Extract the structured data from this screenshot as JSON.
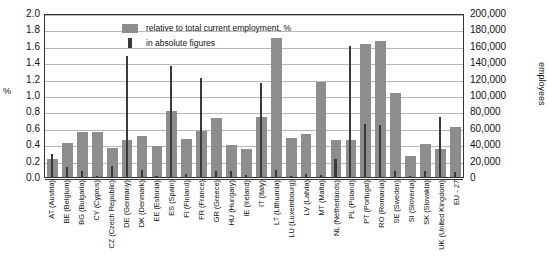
{
  "chart_data": {
    "type": "bar",
    "title": "",
    "xlabel": "",
    "ylabel": "%",
    "ylabel_right": "employees",
    "ylim": [
      0,
      2.0
    ],
    "ylim_right": [
      0,
      200000
    ],
    "yticks": [
      "2.0",
      "1.8",
      "1.6",
      "1.4",
      "1.2",
      "1.0",
      "0.8",
      "0.6",
      "0.4",
      "0.2",
      "0.0"
    ],
    "yticks_right": [
      "200,000",
      "180,000",
      "160,000",
      "140,000",
      "120,000",
      "100,000",
      "80,000",
      "60,000",
      "40,000",
      "20,000",
      "0"
    ],
    "grid": true,
    "legend_position": "top-center",
    "legend": [
      {
        "key": "relative",
        "label": "relative to total current employment, %",
        "color": "#8d8d8d",
        "marker": "wide-bar"
      },
      {
        "key": "absolute",
        "label": "in absolute figures",
        "color": "#3a3a3a",
        "marker": "narrow-bar"
      }
    ],
    "categories": [
      "AT (Austria)",
      "BE (Belgium)",
      "BG (Bulgaria)",
      "CY (Cyprus)",
      "CZ (Czech Republic)",
      "DE (Germany)",
      "DK (Denmark)",
      "EE (Estonia)",
      "ES (Spain)",
      "FI (Finland)",
      "FR (France)",
      "GR (Greece)",
      "HU (Hungary)",
      "IE (Ireland)",
      "IT (Italy)",
      "LT (Lithuania)",
      "LU (Luxembourg)",
      "LV (Latvia)",
      "MT (Malta)",
      "NL (Netherlands)",
      "PL (Poland)",
      "PT (Portugal)",
      "RO (Romania)",
      "SE (Sweden)",
      "SI (Slovenia)",
      "SK (Slovakia)",
      "UK (United Kingdom)",
      "EU - 27"
    ],
    "series": [
      {
        "name": "relative to total current employment, %",
        "unit": "%",
        "axis": "left",
        "color": "#8d8d8d",
        "values": [
          0.22,
          0.41,
          0.55,
          0.55,
          0.35,
          0.45,
          0.5,
          0.38,
          0.81,
          0.46,
          0.56,
          0.72,
          0.39,
          0.34,
          0.73,
          1.7,
          0.48,
          0.52,
          1.16,
          0.45,
          0.45,
          1.62,
          1.66,
          1.02,
          0.26,
          0.4,
          0.34,
          0.61
        ]
      },
      {
        "name": "in absolute figures",
        "unit": "employees",
        "axis": "right",
        "color": "#3a3a3a",
        "values": [
          28000,
          12000,
          7000,
          1000,
          14000,
          147000,
          8000,
          1000,
          135000,
          4000,
          121000,
          7000,
          7000,
          3000,
          115000,
          8000,
          1000,
          4000,
          3000,
          22000,
          160000,
          65000,
          64000,
          7000,
          1000,
          7000,
          73000,
          6000
        ]
      }
    ]
  }
}
